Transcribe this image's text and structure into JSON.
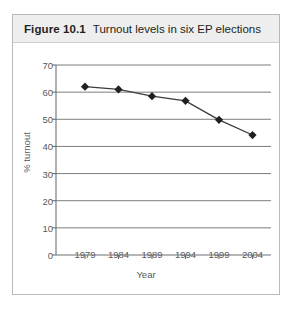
{
  "figure": {
    "caption_number": "Figure 10.1",
    "caption_text": "Turnout levels in six EP elections"
  },
  "colors": {
    "caption_band": "#eeeeee",
    "figure_border": "#b9b9b9",
    "gridline": "#6d6e71",
    "axis": "#6d6e71",
    "series_line": "#3b3b3b",
    "marker": "#231f20",
    "text": "#58585b"
  },
  "chart_data": {
    "type": "line",
    "title": "Turnout levels in six EP elections",
    "xlabel": "Year",
    "ylabel": "% turnout",
    "categories": [
      "1979",
      "1984",
      "1989",
      "1994",
      "1999",
      "2004"
    ],
    "x": [
      1979,
      1984,
      1989,
      1994,
      1999,
      2004
    ],
    "values": [
      62.0,
      61.0,
      58.5,
      56.8,
      49.8,
      44.2
    ],
    "series": [
      {
        "name": "% turnout",
        "values": [
          62.0,
          61.0,
          58.5,
          56.8,
          49.8,
          44.2
        ]
      }
    ],
    "ylim": [
      0,
      70
    ],
    "yticks": [
      0,
      10,
      20,
      30,
      40,
      50,
      60,
      70
    ],
    "ytick_labels": [
      "0",
      "10",
      "20",
      "30",
      "40",
      "50",
      "60",
      "70"
    ],
    "xtick_labels": [
      "1979",
      "1984",
      "1989",
      "1994",
      "1999",
      "2004"
    ],
    "grid": "horizontal",
    "legend": "none",
    "marker": "diamond"
  }
}
